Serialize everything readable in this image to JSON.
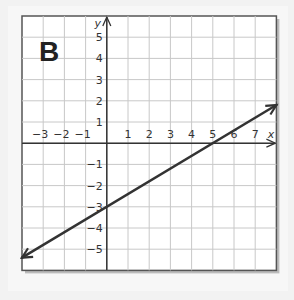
{
  "panel_label": "B",
  "chart_data": {
    "type": "line",
    "title": "B",
    "xlabel": "x",
    "ylabel": "y",
    "xlim": [
      -4,
      8
    ],
    "ylim": [
      -6,
      6
    ],
    "grid": true,
    "x_ticks": [
      "-3",
      "-2",
      "-1",
      "1",
      "2",
      "3",
      "4",
      "5",
      "6",
      "7"
    ],
    "y_ticks": [
      "5",
      "4",
      "3",
      "2",
      "1",
      "-1",
      "-2",
      "-3",
      "-4",
      "-5"
    ],
    "series": [
      {
        "name": "line",
        "equation": "y = (3/5)x - 3",
        "slope": 0.6,
        "y_intercept": -3,
        "x_intercept": 5,
        "x": [
          -4,
          0,
          5,
          8
        ],
        "y": [
          -5.4,
          -3,
          0,
          1.8
        ],
        "arrows": "both"
      }
    ]
  }
}
